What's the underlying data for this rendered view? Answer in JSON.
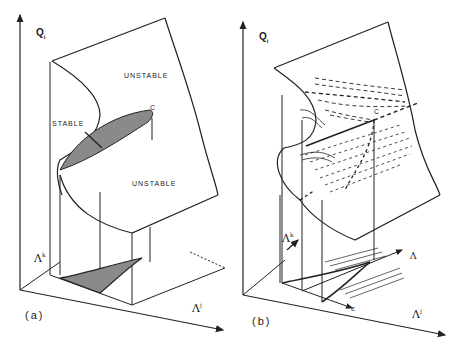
{
  "figure": {
    "panel_a": {
      "label": "(a)",
      "axis_vertical": {
        "symbol": "Q",
        "subscript": "i"
      },
      "axis_horizontal": {
        "symbol": "Λ",
        "superscript": "j"
      },
      "axis_depth": {
        "symbol": "Λ",
        "superscript": "k"
      },
      "region_labels": {
        "unstable_top": "UNSTABLE",
        "stable": "STABLE",
        "unstable_bottom": "UNSTABLE",
        "cusp_point": "C"
      }
    },
    "panel_b": {
      "label": "(b)",
      "axis_vertical": {
        "symbol": "Q",
        "subscript": "i"
      },
      "axis_horizontal": {
        "symbol": "Λ",
        "superscript": "j"
      },
      "axis_depth": {
        "symbol": "Λ",
        "superscript": "k"
      },
      "control_axis_1": "Λ",
      "control_axis_2": "ε",
      "cusp_point": "C"
    },
    "colors": {
      "line": "#222222",
      "shade": "#8a8a8a",
      "background": "#ffffff"
    }
  }
}
